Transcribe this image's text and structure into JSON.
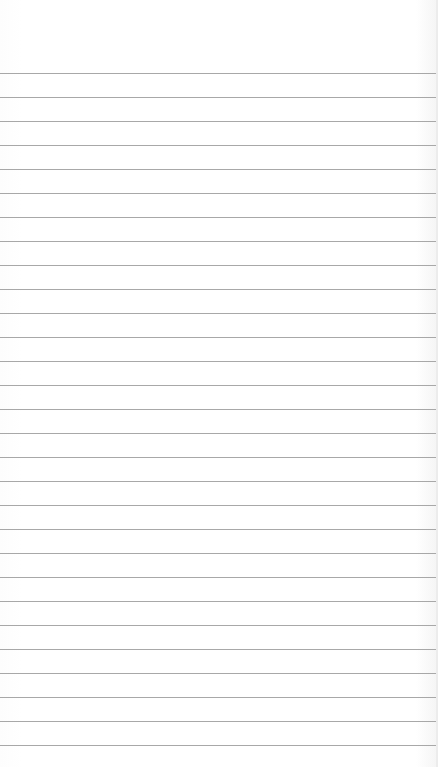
{
  "page": {
    "type": "lined-notepad",
    "background_color": "#ffffff",
    "rule_color": "#a8a8a8",
    "first_rule_y": 73,
    "rule_spacing": 24,
    "rule_count": 29
  }
}
